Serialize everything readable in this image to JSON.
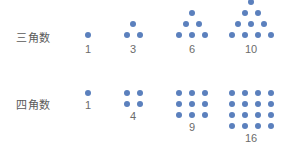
{
  "figure": {
    "background_color": "#ffffff",
    "dot_color": "#5b80bd",
    "label_color": "#5a5a5a",
    "count_color": "#6b6b6b"
  },
  "rows": [
    {
      "key": "triangular",
      "label": "三角数",
      "shape": "triangle",
      "alignment": "bottom",
      "groups": [
        {
          "count": "1",
          "rows": [
            1
          ]
        },
        {
          "count": "3",
          "rows": [
            1,
            2
          ]
        },
        {
          "count": "6",
          "rows": [
            1,
            2,
            3
          ]
        },
        {
          "count": "10",
          "rows": [
            1,
            2,
            3,
            4
          ]
        }
      ]
    },
    {
      "key": "square",
      "label": "四角数",
      "shape": "square",
      "alignment": "top",
      "groups": [
        {
          "count": "1",
          "rows": [
            1
          ]
        },
        {
          "count": "4",
          "rows": [
            2,
            2
          ]
        },
        {
          "count": "9",
          "rows": [
            3,
            3,
            3
          ]
        },
        {
          "count": "16",
          "rows": [
            4,
            4,
            4,
            4
          ]
        }
      ]
    }
  ],
  "chart_data": {
    "type": "scatter",
    "title": "",
    "xlabel": "",
    "ylabel": "",
    "series": [
      {
        "name": "三角数",
        "categories": [
          "1",
          "2",
          "3",
          "4"
        ],
        "values": [
          1,
          3,
          6,
          10
        ]
      },
      {
        "name": "四角数",
        "categories": [
          "1",
          "2",
          "3",
          "4"
        ],
        "values": [
          1,
          4,
          9,
          16
        ]
      }
    ],
    "legend": [
      "三角数",
      "四角数"
    ],
    "grid": false
  }
}
